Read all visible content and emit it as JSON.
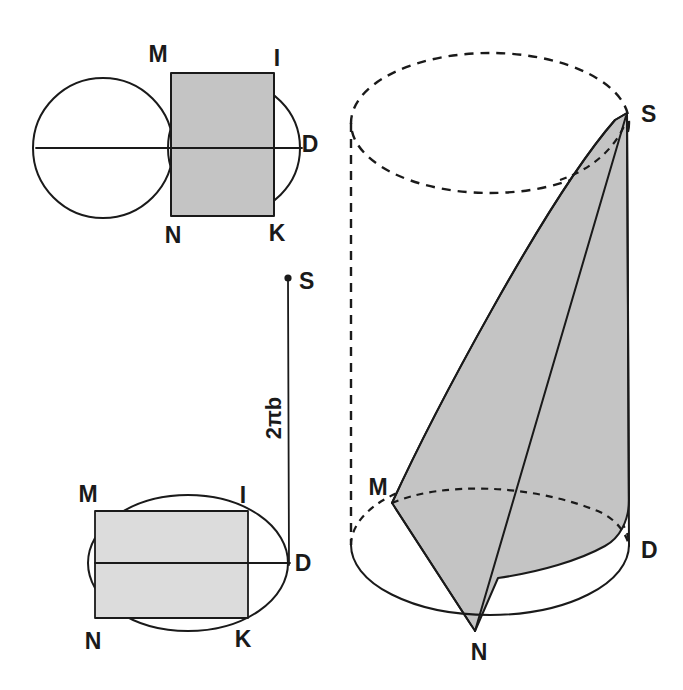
{
  "figure": {
    "background_color": "#ffffff",
    "ink_color": "#1a1a1a",
    "shade_color": "#c4c4c4",
    "shade_color_light": "#dcdcdc"
  },
  "top_left_figure": {
    "name": "two-circles-with-shaded-rectangle",
    "labels": {
      "m": "M",
      "i": "I",
      "d": "D",
      "n": "N",
      "k": "K"
    },
    "left_circle": {
      "cx": 103,
      "cy": 148,
      "r": 70
    },
    "right_circle": {
      "cx": 234,
      "cy": 148,
      "r": 66
    },
    "rectangle": {
      "x": 171,
      "y": 73,
      "width": 103,
      "height": 143
    },
    "axis_line": {
      "x1": 36,
      "y1": 148,
      "x2": 302,
      "y2": 148
    }
  },
  "bottom_left_figure": {
    "name": "ellipse-with-shaded-rectangle",
    "labels": {
      "m": "M",
      "i": "I",
      "d": "D",
      "n": "N",
      "k": "K"
    },
    "ellipse": {
      "cx": 188,
      "cy": 563,
      "rx": 100,
      "ry": 68
    },
    "rectangle": {
      "x": 95,
      "y": 511,
      "width": 153,
      "height": 107
    },
    "axis_line": {
      "x1": 95,
      "y1": 563,
      "x2": 290,
      "y2": 563
    }
  },
  "measure_figure": {
    "name": "vertical-measure-segment",
    "label": "2πb",
    "apex_label": "S",
    "segment": {
      "x1": 289,
      "y1": 563,
      "x2": 288,
      "y2": 278
    },
    "label_rotation_deg": -90
  },
  "right_figure": {
    "name": "cylinder-with-inscribed-cone",
    "labels": {
      "s": "S",
      "m": "M",
      "d": "D",
      "n": "N"
    },
    "top_ellipse": {
      "cx": 490,
      "cy": 123,
      "rx": 139,
      "ry": 70,
      "style": "dashed"
    },
    "bottom_ellipse": {
      "cx": 490,
      "cy": 545,
      "rx": 139,
      "ry": 70,
      "front": "solid",
      "back": "dashed"
    },
    "left_edge": {
      "x1": 351,
      "y1": 123,
      "x2": 351,
      "y2": 545,
      "style": "dashed"
    },
    "right_edge": {
      "x1": 629,
      "y1": 123,
      "x2": 629,
      "y2": 545,
      "style": "solid"
    },
    "apex": {
      "x": 627,
      "y": 113
    },
    "vertex_m": {
      "x": 392,
      "y": 503
    },
    "vertex_n": {
      "x": 475,
      "y": 631
    },
    "vertex_d": {
      "x": 629,
      "y": 546
    }
  }
}
